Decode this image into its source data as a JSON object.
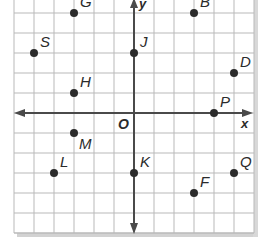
{
  "figure": {
    "type": "coordinate-plane",
    "grid": {
      "x_min": -6,
      "x_max": 6,
      "y_min": -6,
      "y_max": 5,
      "step": 1
    },
    "axes": {
      "x_label": "x",
      "y_label": "y",
      "origin_label": "O"
    },
    "colors": {
      "grid": "#b9b9b9",
      "axis": "#4a4a4a",
      "point": "#2b2b2b",
      "label": "#2b2b2b",
      "shadow": "#cfcfcf"
    },
    "points": [
      {
        "name": "G",
        "x": -3,
        "y": 5
      },
      {
        "name": "B",
        "x": 3,
        "y": 5
      },
      {
        "name": "S",
        "x": -5,
        "y": 3
      },
      {
        "name": "J",
        "x": 0,
        "y": 3
      },
      {
        "name": "D",
        "x": 5,
        "y": 2
      },
      {
        "name": "H",
        "x": -3,
        "y": 1
      },
      {
        "name": "P",
        "x": 4,
        "y": 0
      },
      {
        "name": "M",
        "x": -3,
        "y": -1
      },
      {
        "name": "L",
        "x": -4,
        "y": -3
      },
      {
        "name": "K",
        "x": 0,
        "y": -3
      },
      {
        "name": "Q",
        "x": 5,
        "y": -3
      },
      {
        "name": "F",
        "x": 3,
        "y": -4
      }
    ]
  }
}
